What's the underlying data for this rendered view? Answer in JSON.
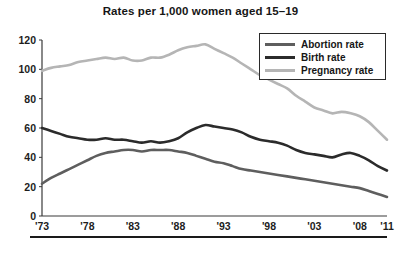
{
  "chart_data": {
    "type": "line",
    "title": "Rates per 1,000 women aged 15–19",
    "xlabel": "",
    "ylabel": "",
    "xlim": [
      1973,
      2011
    ],
    "ylim": [
      0,
      120
    ],
    "grid": false,
    "legend_position": "top-right",
    "x_tick_labels": [
      "'73",
      "'78",
      "'83",
      "'88",
      "'93",
      "'98",
      "'03",
      "'08",
      "'11"
    ],
    "x_tick_values": [
      1973,
      1978,
      1983,
      1988,
      1993,
      1998,
      2003,
      2008,
      2011
    ],
    "y_tick_labels": [
      "0",
      "20",
      "40",
      "60",
      "80",
      "100",
      "120"
    ],
    "y_tick_values": [
      0,
      20,
      40,
      60,
      80,
      100,
      120
    ],
    "x": [
      1973,
      1974,
      1975,
      1976,
      1977,
      1978,
      1979,
      1980,
      1981,
      1982,
      1983,
      1984,
      1985,
      1986,
      1987,
      1988,
      1989,
      1990,
      1991,
      1992,
      1993,
      1994,
      1995,
      1996,
      1997,
      1998,
      1999,
      2000,
      2001,
      2002,
      2003,
      2004,
      2005,
      2006,
      2007,
      2008,
      2009,
      2010,
      2011
    ],
    "series": [
      {
        "name": "Abortion rate",
        "color": "#5e5e5e",
        "values": [
          22,
          26,
          29,
          32,
          35,
          38,
          41,
          43,
          44,
          45,
          45,
          44,
          45,
          45,
          45,
          44,
          43,
          41,
          39,
          37,
          36,
          34,
          32,
          31,
          30,
          29,
          28,
          27,
          26,
          25,
          24,
          23,
          22,
          21,
          20,
          19,
          17,
          15,
          13
        ]
      },
      {
        "name": "Birth rate",
        "color": "#2b2b2b",
        "values": [
          60,
          58,
          56,
          54,
          53,
          52,
          52,
          53,
          52,
          52,
          51,
          50,
          51,
          50,
          51,
          53,
          57,
          60,
          62,
          61,
          60,
          59,
          57,
          54,
          52,
          51,
          50,
          48,
          45,
          43,
          42,
          41,
          40,
          42,
          43,
          41,
          38,
          34,
          31
        ]
      },
      {
        "name": "Pregnancy rate",
        "color": "#b5b5b5",
        "values": [
          99,
          101,
          102,
          103,
          105,
          106,
          107,
          108,
          107,
          108,
          106,
          106,
          108,
          108,
          110,
          113,
          115,
          116,
          117,
          114,
          111,
          108,
          104,
          100,
          96,
          93,
          90,
          87,
          82,
          78,
          74,
          72,
          70,
          71,
          70,
          68,
          64,
          58,
          52
        ]
      }
    ]
  },
  "legend": {
    "items": [
      {
        "label": "Abortion rate",
        "color": "#5e5e5e"
      },
      {
        "label": "Birth rate",
        "color": "#2b2b2b"
      },
      {
        "label": "Pregnancy rate",
        "color": "#b5b5b5"
      }
    ]
  }
}
